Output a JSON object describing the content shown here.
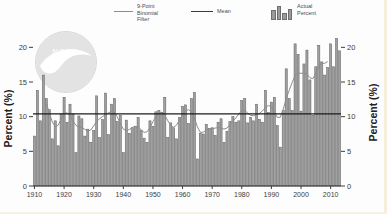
{
  "legend": {
    "items": [
      {
        "label": "9-Point Binomial Filter",
        "swatch": "thin-line"
      },
      {
        "label": "Mean",
        "swatch": "mean-line"
      },
      {
        "label": "Actual Percent",
        "swatch": "mini-bars"
      }
    ]
  },
  "watermark": {
    "org": "NOAA"
  },
  "colors": {
    "bar_fill": "#a0a0a0",
    "bar_stroke": "#5f5f5f",
    "mean_line": "#1b1b1b",
    "filter_line": "#8c8c8c",
    "axis_line": "#2a2a2a",
    "axis_text": "#3c3c3c",
    "watermark_fill": "#e3e3e3",
    "watermark_ring": "#d8d8d8"
  },
  "chart_data": {
    "type": "bar",
    "title": "",
    "ylabel_left": "Percent (%)",
    "ylabel_right": "Percent (%)",
    "start_year": 1910,
    "x_tick_labels": [
      "1910",
      "1920",
      "1930",
      "1940",
      "1950",
      "1960",
      "1970",
      "1980",
      "1990",
      "2000",
      "2010"
    ],
    "y_tick_labels": [
      "0",
      "5",
      "10",
      "15",
      "20"
    ],
    "y_tick_values": [
      0,
      5,
      10,
      15,
      20
    ],
    "ylim": [
      0,
      22.5
    ],
    "grid": false,
    "legend_position": "top-center",
    "mean": 10.4,
    "series": [
      {
        "name": "Actual Percent",
        "type": "bar"
      },
      {
        "name": "Mean",
        "type": "horizontal-line",
        "value": 10.4
      },
      {
        "name": "9-Point Binomial Filter",
        "type": "smoothed-line",
        "derived_from": "Actual Percent"
      }
    ],
    "years_range": [
      1910,
      2013
    ],
    "values": [
      7.2,
      13.8,
      9.4,
      16.0,
      12.6,
      11.0,
      6.8,
      9.4,
      5.8,
      10.4,
      12.8,
      9.2,
      11.8,
      10.4,
      4.8,
      10.1,
      9.7,
      7.2,
      8.2,
      6.3,
      8.0,
      13.0,
      7.0,
      9.6,
      13.4,
      7.4,
      11.8,
      12.6,
      9.3,
      10.2,
      4.8,
      9.5,
      7.6,
      8.4,
      8.6,
      9.9,
      8.0,
      6.9,
      6.3,
      9.4,
      8.6,
      10.7,
      10.9,
      10.6,
      12.8,
      7.0,
      9.1,
      8.4,
      6.8,
      9.9,
      11.5,
      11.7,
      9.0,
      12.6,
      13.5,
      3.9,
      7.6,
      7.5,
      8.9,
      8.3,
      8.4,
      7.3,
      9.2,
      9.7,
      6.3,
      7.9,
      9.3,
      10.0,
      9.2,
      9.4,
      12.3,
      12.6,
      9.1,
      9.9,
      9.4,
      11.8,
      9.6,
      9.2,
      13.8,
      10.6,
      12.1,
      12.8,
      8.7,
      5.6,
      10.9,
      16.9,
      12.6,
      10.9,
      20.5,
      19.0,
      10.8,
      17.6,
      19.6,
      15.3,
      10.2,
      17.2,
      20.3,
      17.9,
      16.0,
      17.1,
      20.5,
      17.2,
      21.3,
      19.5
    ]
  }
}
